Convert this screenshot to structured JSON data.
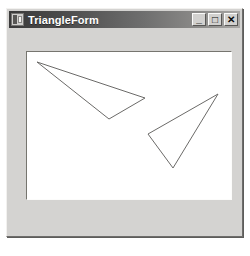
{
  "window": {
    "title": "TriangleForm",
    "icon": "form-window-icon",
    "buttons": [
      {
        "name": "minimize",
        "glyph": "_",
        "tooltip": "Minimize"
      },
      {
        "name": "maximize",
        "glyph": "□",
        "tooltip": "Maximize"
      },
      {
        "name": "close",
        "glyph": "✕",
        "tooltip": "Close"
      }
    ]
  },
  "canvas": {
    "name": "triangle-drawing-canvas",
    "background_color": "#ffffff",
    "stroke_color": "#6b6a68",
    "stroke_width": 1,
    "view_box": "0 0 204 147",
    "shapes": [
      {
        "name": "triangle-upper-left",
        "type": "triangle",
        "points": "10,10 118,46 82,67",
        "vertices": [
          {
            "x": 10,
            "y": 10
          },
          {
            "x": 118,
            "y": 46
          },
          {
            "x": 82,
            "y": 67
          }
        ]
      },
      {
        "name": "triangle-lower-right",
        "type": "triangle",
        "points": "191,42 121,82 146,116",
        "vertices": [
          {
            "x": 191,
            "y": 42
          },
          {
            "x": 121,
            "y": 82
          },
          {
            "x": 146,
            "y": 116
          }
        ]
      }
    ]
  },
  "colors": {
    "window_face": "#d4d3d1",
    "title_bar_start": "#3a3a3a",
    "title_bar_end": "#a9a8a6",
    "title_text": "#ffffff",
    "canvas_background": "#ffffff",
    "shape_stroke": "#6b6a68"
  }
}
